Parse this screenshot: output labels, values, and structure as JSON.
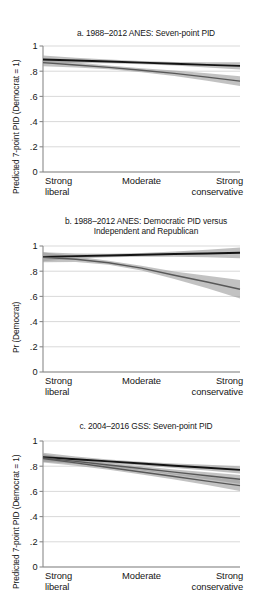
{
  "figure": {
    "width": 272,
    "height": 592,
    "background": "#ffffff",
    "line_dark_color": "#131313",
    "line_gray_color": "#585858",
    "ci_band_color": "#a8a8a8",
    "grid_color": "#c9c9c9"
  },
  "panels": {
    "a": {
      "title": "a. 1988–2012 ANES: Seven-point PID",
      "ylabel": "Predicted 7-point PID (Democrat = 1)",
      "ytick_labels": [
        "0",
        ".2",
        ".4",
        ".6",
        ".8",
        "1"
      ],
      "xcat_left_line1": "Strong",
      "xcat_left_line2": "liberal",
      "xcat_mid": "Moderate",
      "xcat_right_line1": "Strong",
      "xcat_right_line2": "conservative"
    },
    "b": {
      "title_line1": "b. 1988–2012 ANES: Democratic PID versus",
      "title_line2": "Independent and Republican",
      "ylabel": "Pr (Democrat)",
      "ytick_labels": [
        "0",
        ".2",
        ".4",
        ".6",
        ".8",
        "1"
      ],
      "xcat_left_line1": "Strong",
      "xcat_left_line2": "liberal",
      "xcat_mid": "Moderate",
      "xcat_right_line1": "Strong",
      "xcat_right_line2": "conservative"
    },
    "c": {
      "title": "c. 2004–2016 GSS: Seven-point PID",
      "ylabel": "Predicted 7-point PID (Democrat = 1)",
      "ytick_labels": [
        "0",
        ".2",
        ".4",
        ".6",
        ".8",
        "1"
      ],
      "xcat_left_line1": "Strong",
      "xcat_left_line2": "liberal",
      "xcat_mid": "Moderate",
      "xcat_right_line1": "Strong",
      "xcat_right_line2": "conservative"
    }
  },
  "chart_data": [
    {
      "type": "line",
      "panel": "a",
      "title": "a. 1988–2012 ANES: Seven-point PID",
      "xlabel": "",
      "ylabel": "Predicted 7-point PID (Democrat = 1)",
      "ylim": [
        0,
        1
      ],
      "yticks": [
        0,
        0.2,
        0.4,
        0.6,
        0.8,
        1
      ],
      "grid": true,
      "legend": "none",
      "x": [
        "Strong liberal",
        "Moderate",
        "Strong conservative"
      ],
      "x_numeric": [
        1,
        4,
        7
      ],
      "series": [
        {
          "name": "dark line",
          "style": "solid-dark",
          "x": [
            1,
            2,
            3,
            4,
            5,
            6,
            7
          ],
          "values": [
            0.893,
            0.885,
            0.877,
            0.868,
            0.859,
            0.85,
            0.842
          ],
          "ci_lower": [
            0.862,
            0.866,
            0.864,
            0.856,
            0.845,
            0.83,
            0.813
          ],
          "ci_upper": [
            0.924,
            0.906,
            0.892,
            0.881,
            0.874,
            0.871,
            0.872
          ]
        },
        {
          "name": "gray line",
          "style": "solid-gray",
          "x": [
            1,
            2,
            3,
            4,
            5,
            6,
            7
          ],
          "values": [
            0.868,
            0.849,
            0.83,
            0.807,
            0.783,
            0.753,
            0.721
          ],
          "ci_lower": [
            0.84,
            0.83,
            0.816,
            0.792,
            0.762,
            0.724,
            0.683
          ],
          "ci_upper": [
            0.896,
            0.869,
            0.845,
            0.823,
            0.805,
            0.783,
            0.76
          ]
        }
      ]
    },
    {
      "type": "line",
      "panel": "b",
      "title": "b. 1988–2012 ANES: Democratic PID versus Independent and Republican",
      "xlabel": "",
      "ylabel": "Pr (Democrat)",
      "ylim": [
        0,
        1
      ],
      "yticks": [
        0,
        0.2,
        0.4,
        0.6,
        0.8,
        1
      ],
      "grid": true,
      "legend": "none",
      "x": [
        "Strong liberal",
        "Moderate",
        "Strong conservative"
      ],
      "x_numeric": [
        1,
        4,
        7
      ],
      "series": [
        {
          "name": "dark line",
          "style": "solid-dark",
          "x": [
            1,
            2,
            3,
            4,
            5,
            6,
            7
          ],
          "values": [
            0.914,
            0.92,
            0.925,
            0.93,
            0.936,
            0.941,
            0.946
          ],
          "ci_lower": [
            0.878,
            0.9,
            0.911,
            0.915,
            0.915,
            0.911,
            0.903
          ],
          "ci_upper": [
            0.95,
            0.94,
            0.939,
            0.945,
            0.957,
            0.971,
            0.989
          ]
        },
        {
          "name": "gray line",
          "style": "solid-gray",
          "x": [
            1,
            2,
            3,
            4,
            5,
            6,
            7
          ],
          "values": [
            0.911,
            0.895,
            0.867,
            0.824,
            0.768,
            0.714,
            0.657
          ],
          "ci_lower": [
            0.872,
            0.873,
            0.851,
            0.805,
            0.738,
            0.664,
            0.583
          ],
          "ci_upper": [
            0.95,
            0.917,
            0.883,
            0.843,
            0.798,
            0.764,
            0.731
          ]
        }
      ]
    },
    {
      "type": "line",
      "panel": "c",
      "title": "c. 2004–2016 GSS: Seven-point PID",
      "xlabel": "",
      "ylabel": "Predicted 7-point PID (Democrat = 1)",
      "ylim": [
        0,
        1
      ],
      "yticks": [
        0,
        0.2,
        0.4,
        0.6,
        0.8,
        1
      ],
      "grid": true,
      "legend": "none",
      "x": [
        "Strong liberal",
        "Moderate",
        "Strong conservative"
      ],
      "x_numeric": [
        1,
        4,
        7
      ],
      "series": [
        {
          "name": "dark line",
          "style": "solid-dark",
          "x": [
            1,
            2,
            3,
            4,
            5,
            6,
            7
          ],
          "values": [
            0.872,
            0.855,
            0.838,
            0.821,
            0.804,
            0.788,
            0.771
          ],
          "ci_lower": [
            0.838,
            0.833,
            0.822,
            0.806,
            0.786,
            0.765,
            0.742
          ],
          "ci_upper": [
            0.906,
            0.877,
            0.854,
            0.836,
            0.822,
            0.811,
            0.8
          ]
        },
        {
          "name": "gray line upper",
          "style": "solid-gray",
          "x": [
            1,
            2,
            3,
            4,
            5,
            6,
            7
          ],
          "values": [
            0.866,
            0.838,
            0.81,
            0.782,
            0.753,
            0.724,
            0.696
          ],
          "ci_lower": [
            0.836,
            0.818,
            0.794,
            0.765,
            0.732,
            0.697,
            0.661
          ],
          "ci_upper": [
            0.896,
            0.858,
            0.826,
            0.799,
            0.774,
            0.751,
            0.731
          ]
        },
        {
          "name": "gray line lower",
          "style": "solid-gray",
          "x": [
            1,
            2,
            3,
            4,
            5,
            6,
            7
          ],
          "values": [
            0.861,
            0.826,
            0.79,
            0.754,
            0.718,
            0.682,
            0.646
          ],
          "ci_lower": [
            0.829,
            0.804,
            0.772,
            0.735,
            0.694,
            0.65,
            0.604
          ],
          "ci_upper": [
            0.893,
            0.848,
            0.808,
            0.773,
            0.742,
            0.714,
            0.688
          ]
        }
      ]
    }
  ]
}
